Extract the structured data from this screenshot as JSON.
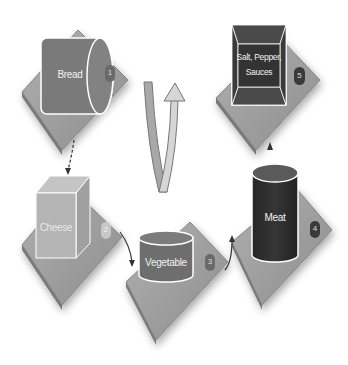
{
  "diagram": {
    "type": "process-cycle",
    "colors": {
      "plate": "#9a9a9a",
      "plate_edge": "#7c7c7c",
      "bread": "#7a7a7a",
      "cheese": "#b4b4b4",
      "vegetable": "#6e6e6e",
      "meat": "#2e2e2e",
      "box": "#3a3a3a",
      "box_bevel": "#555555",
      "arrow_left": "#a8a8a8",
      "arrow_right": "#d2d2d2",
      "outline": "#ffffff"
    },
    "steps": [
      {
        "label": "Bread",
        "number": "1",
        "shape": "cylinder-horizontal"
      },
      {
        "label": "Cheese",
        "number": "2",
        "shape": "cube"
      },
      {
        "label": "Vegetable",
        "number": "3",
        "shape": "cylinder-short"
      },
      {
        "label": "Meat",
        "number": "4",
        "shape": "cylinder-tall"
      },
      {
        "label_line1": "Salt, Pepper,",
        "label_line2": "Sauces",
        "number": "5",
        "shape": "beveled-box"
      }
    ],
    "center_arrow": "u-turn-arrow-up"
  }
}
